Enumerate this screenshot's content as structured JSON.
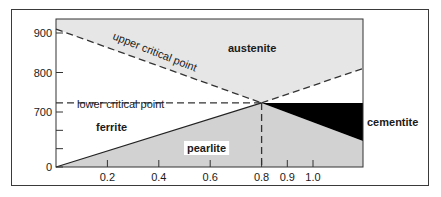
{
  "chart_data": {
    "type": "phase-diagram",
    "title": "",
    "xlabel": "",
    "ylabel": "",
    "x_range": [
      0,
      1.2
    ],
    "y_ticks": [
      {
        "value": 900,
        "label": "900"
      },
      {
        "value": 800,
        "label": "800"
      },
      {
        "value": 700,
        "label": "700"
      },
      {
        "value": 0,
        "label": "0"
      }
    ],
    "y_minor_ticks_below_700": 2,
    "x_ticks": [
      {
        "value": 0.2,
        "label": "0.2"
      },
      {
        "value": 0.4,
        "label": "0.4"
      },
      {
        "value": 0.6,
        "label": "0.6"
      },
      {
        "value": 0.8,
        "label": "0.8"
      },
      {
        "value": 0.9,
        "label": "0.9"
      },
      {
        "value": 1.0,
        "label": "1.0"
      }
    ],
    "eutectoid_point": {
      "x": 0.8,
      "y": 723
    },
    "lines": {
      "upper_critical_point": {
        "label": "upper critical point",
        "from": {
          "x": 0,
          "y": 910
        },
        "to": {
          "x": 0.8,
          "y": 723
        },
        "style": "dashed"
      },
      "acm_line": {
        "from": {
          "x": 0.8,
          "y": 723
        },
        "to": {
          "x": 1.2,
          "y": 810
        },
        "style": "dashed"
      },
      "lower_critical_point": {
        "label": "lower critical point",
        "from": {
          "x": 0,
          "y": 723
        },
        "to": {
          "x": 0.8,
          "y": 723
        },
        "style": "dashed"
      },
      "eutectoid_vertical": {
        "from": {
          "x": 0.8,
          "y": 723
        },
        "to": {
          "x": 0.8,
          "y": 0
        },
        "style": "dashed"
      }
    },
    "regions": [
      {
        "name": "austenite",
        "label": "austenite",
        "fill": "#e6e6e6"
      },
      {
        "name": "ferrite",
        "label": "ferrite",
        "fill": "#ffffff"
      },
      {
        "name": "pearlite",
        "label": "pearlite",
        "fill": "#d2d2d2"
      },
      {
        "name": "cementite",
        "label": "cementite",
        "fill": "#000000"
      }
    ]
  }
}
